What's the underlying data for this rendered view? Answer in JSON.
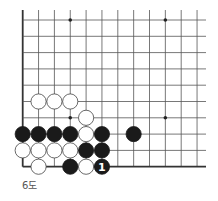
{
  "diagram": {
    "caption": "6도",
    "board": {
      "origin_x": 22.7,
      "origin_y": 20,
      "col_spacing": 15.85,
      "row_spacing": 16.3,
      "cols": 12,
      "rows": 10,
      "top_extend": 10,
      "right_extend": 206,
      "left_edge": true,
      "bottom_edge": true,
      "stone_radius": 7.6,
      "line_color": "#555555",
      "edge_color": "#333333",
      "black_color": "#1a1a1a",
      "white_color": "#ffffff",
      "stone_outline": "#444444"
    },
    "star_points": [
      {
        "col": 3,
        "row": 0
      },
      {
        "col": 9,
        "row": 0
      },
      {
        "col": 3,
        "row": 6
      },
      {
        "col": 9,
        "row": 6
      }
    ],
    "stones": [
      {
        "col": 1,
        "row": 5,
        "color": "white"
      },
      {
        "col": 2,
        "row": 5,
        "color": "white"
      },
      {
        "col": 3,
        "row": 5,
        "color": "white"
      },
      {
        "col": 4,
        "row": 6,
        "color": "white"
      },
      {
        "col": 0,
        "row": 7,
        "color": "black"
      },
      {
        "col": 1,
        "row": 7,
        "color": "black"
      },
      {
        "col": 2,
        "row": 7,
        "color": "black"
      },
      {
        "col": 3,
        "row": 7,
        "color": "black"
      },
      {
        "col": 4,
        "row": 7,
        "color": "white"
      },
      {
        "col": 5,
        "row": 7,
        "color": "black"
      },
      {
        "col": 7,
        "row": 7,
        "color": "black"
      },
      {
        "col": 0,
        "row": 8,
        "color": "white"
      },
      {
        "col": 1,
        "row": 8,
        "color": "white"
      },
      {
        "col": 2,
        "row": 8,
        "color": "white"
      },
      {
        "col": 3,
        "row": 8,
        "color": "white"
      },
      {
        "col": 4,
        "row": 8,
        "color": "black"
      },
      {
        "col": 5,
        "row": 8,
        "color": "black"
      },
      {
        "col": 1,
        "row": 9,
        "color": "white"
      },
      {
        "col": 3,
        "row": 9,
        "color": "black"
      },
      {
        "col": 4,
        "row": 9,
        "color": "white"
      },
      {
        "col": 5,
        "row": 9,
        "color": "black",
        "label": "1"
      }
    ]
  }
}
